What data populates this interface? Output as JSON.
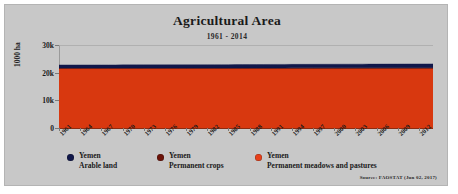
{
  "chart_data": {
    "type": "area",
    "stacked": true,
    "title": "Agricultural Area",
    "subtitle": "1961 - 2014",
    "xlabel": "",
    "ylabel": "1000 ha",
    "ylim": [
      0,
      30000
    ],
    "ytick_labels": [
      "0",
      "10k",
      "20k",
      "30k"
    ],
    "ytick_values": [
      0,
      10000,
      20000,
      30000
    ],
    "grid": true,
    "legend_position": "bottom",
    "x": [
      1961,
      1962,
      1963,
      1964,
      1965,
      1966,
      1967,
      1968,
      1969,
      1970,
      1971,
      1972,
      1973,
      1974,
      1975,
      1976,
      1977,
      1978,
      1979,
      1980,
      1981,
      1982,
      1983,
      1984,
      1985,
      1986,
      1987,
      1988,
      1989,
      1990,
      1991,
      1992,
      1993,
      1994,
      1995,
      1996,
      1997,
      1998,
      1999,
      2000,
      2001,
      2002,
      2003,
      2004,
      2005,
      2006,
      2007,
      2008,
      2009,
      2010,
      2011,
      2012,
      2013,
      2014
    ],
    "xtick_labels": [
      "1961",
      "1964",
      "1967",
      "1970",
      "1973",
      "1976",
      "1979",
      "1982",
      "1985",
      "1988",
      "1991",
      "1994",
      "1997",
      "2000",
      "2003",
      "2006",
      "2009",
      "2012"
    ],
    "series": [
      {
        "name": "Yemen Permanent meadows and pastures",
        "color": "#d8380f",
        "values": [
          21500,
          21500,
          21500,
          21500,
          21500,
          21500,
          21500,
          21500,
          21500,
          21500,
          21500,
          21500,
          21500,
          21500,
          21500,
          21500,
          21500,
          21500,
          21500,
          21500,
          21500,
          21500,
          21500,
          21500,
          21500,
          21500,
          21500,
          21500,
          21500,
          21500,
          21500,
          21500,
          21500,
          21500,
          21500,
          21500,
          21500,
          21500,
          21500,
          21500,
          21500,
          21500,
          21500,
          21500,
          21500,
          21500,
          21500,
          21500,
          21500,
          21500,
          21500,
          21500,
          21500,
          21500
        ]
      },
      {
        "name": "Yemen Permanent crops",
        "color": "#6b1208",
        "values": [
          150,
          152,
          154,
          156,
          158,
          160,
          162,
          164,
          166,
          168,
          170,
          172,
          174,
          176,
          178,
          180,
          182,
          184,
          186,
          188,
          190,
          192,
          194,
          196,
          198,
          200,
          204,
          208,
          212,
          216,
          220,
          224,
          228,
          232,
          236,
          240,
          244,
          248,
          252,
          256,
          260,
          264,
          268,
          272,
          276,
          280,
          284,
          288,
          292,
          296,
          300,
          304,
          308,
          312
        ]
      },
      {
        "name": "Yemen Arable land",
        "color": "#10174a",
        "values": [
          1150,
          1150,
          1150,
          1150,
          1150,
          1150,
          1150,
          1150,
          1150,
          1150,
          1150,
          1150,
          1150,
          1150,
          1155,
          1160,
          1165,
          1170,
          1175,
          1180,
          1185,
          1190,
          1195,
          1200,
          1205,
          1210,
          1215,
          1220,
          1230,
          1240,
          1250,
          1255,
          1260,
          1265,
          1270,
          1275,
          1280,
          1285,
          1290,
          1295,
          1300,
          1305,
          1310,
          1315,
          1320,
          1325,
          1330,
          1335,
          1340,
          1345,
          1350,
          1355,
          1360,
          1365
        ]
      }
    ],
    "totals_note": "Stacked total approximately 22.8k thousand ha, slowly rising"
  },
  "legend": {
    "items": [
      {
        "country": "Yemen",
        "category": "Arable land",
        "color": "#10174a"
      },
      {
        "country": "Yemen",
        "category": "Permanent crops",
        "color": "#6b1208"
      },
      {
        "country": "Yemen",
        "category": "Permanent meadows and pastures",
        "color": "#e8401a"
      }
    ]
  },
  "source": "Source: FAOSTAT (Jun 02, 2017)"
}
